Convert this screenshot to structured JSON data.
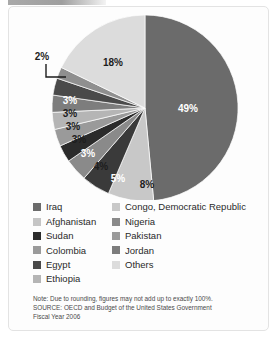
{
  "chart_data": {
    "type": "pie",
    "title": "",
    "subtitle": "",
    "legend_position": "bottom",
    "grid": false,
    "units": "percent",
    "start_angle_deg": 0,
    "direction": "clockwise",
    "categories": [
      "Iraq",
      "Congo, Democratic Republic",
      "Afghanistan",
      "Nigeria",
      "Sudan",
      "Pakistan",
      "Colombia",
      "Jordan",
      "Egypt",
      "Ethiopia",
      "Others"
    ],
    "values": [
      49,
      8,
      5,
      4,
      3,
      3,
      3,
      3,
      3,
      2,
      18
    ],
    "value_labels": [
      "49%",
      "8%",
      "5%",
      "4%",
      "3%",
      "3%",
      "3%",
      "3%",
      "3%",
      "2%",
      "18%"
    ],
    "colors": [
      "#6b6b6b",
      "#c8c8c8",
      "#3a3a3a",
      "#8a8a8a",
      "#2b2b2b",
      "#9a9a9a",
      "#b5b5b5",
      "#7d7d7d",
      "#4a4a4a",
      "#8f8f8f",
      "#dcdcdc"
    ],
    "callout_slices": [
      "Ethiopia"
    ],
    "total": 101
  },
  "pie": {
    "center_x": 145,
    "center_y": 108,
    "radius": 93,
    "slices": [
      {
        "name": "Iraq",
        "label": "49%",
        "value": 49,
        "color": "#6b6b6b",
        "label_x": 188,
        "label_y": 112,
        "label_tone": "light",
        "callout": false
      },
      {
        "name": "Congo, Democratic Republic",
        "label": "8%",
        "value": 8,
        "color": "#c8c8c8",
        "label_x": 147,
        "label_y": 188,
        "label_tone": "dark",
        "callout": false
      },
      {
        "name": "Afghanistan",
        "label": "5%",
        "value": 5,
        "color": "#3a3a3a",
        "label_x": 118,
        "label_y": 182,
        "label_tone": "light",
        "callout": false
      },
      {
        "name": "Nigeria",
        "label": "4%",
        "value": 4,
        "color": "#8a8a8a",
        "label_x": 101,
        "label_y": 170,
        "label_tone": "dark",
        "callout": false
      },
      {
        "name": "Sudan",
        "label": "3%",
        "value": 3,
        "color": "#2b2b2b",
        "label_x": 88,
        "label_y": 157,
        "label_tone": "light",
        "callout": false
      },
      {
        "name": "Pakistan",
        "label": "3%",
        "value": 3,
        "color": "#9a9a9a",
        "label_x": 79,
        "label_y": 143,
        "label_tone": "dark",
        "callout": false
      },
      {
        "name": "Colombia",
        "label": "3%",
        "value": 3,
        "color": "#b5b5b5",
        "label_x": 73,
        "label_y": 130,
        "label_tone": "dark",
        "callout": false
      },
      {
        "name": "Jordan",
        "label": "3%",
        "value": 3,
        "color": "#7d7d7d",
        "label_x": 70,
        "label_y": 117,
        "label_tone": "dark",
        "callout": false
      },
      {
        "name": "Egypt",
        "label": "3%",
        "value": 3,
        "color": "#4a4a4a",
        "label_x": 70,
        "label_y": 104,
        "label_tone": "light",
        "callout": false
      },
      {
        "name": "Ethiopia",
        "label": "2%",
        "value": 2,
        "color": "#8f8f8f",
        "label_x": 42,
        "label_y": 60,
        "label_tone": "dark",
        "callout": true
      },
      {
        "name": "Others",
        "label": "18%",
        "value": 18,
        "color": "#dcdcdc",
        "label_x": 113,
        "label_y": 66,
        "label_tone": "dark",
        "callout": false
      }
    ],
    "callout": {
      "label": "2%",
      "label_x": 42,
      "label_y": 60,
      "path": "M 46 64 L 46 77 L 66 77"
    }
  },
  "legend": {
    "left_column": [
      {
        "label": "Iraq",
        "color": "#6b6b6b"
      },
      {
        "label": "Afghanistan",
        "color": "#c5c5c5"
      },
      {
        "label": "Sudan",
        "color": "#2b2b2b"
      },
      {
        "label": "Colombia",
        "color": "#9a9a9a"
      },
      {
        "label": "Egypt",
        "color": "#4a4a4a"
      },
      {
        "label": "Ethiopia",
        "color": "#b5b5b5"
      }
    ],
    "right_column": [
      {
        "label": "Congo, Democratic Republic",
        "color": "#c8c8c8"
      },
      {
        "label": "Nigeria",
        "color": "#8a8a8a"
      },
      {
        "label": "Pakistan",
        "color": "#9a9a9a"
      },
      {
        "label": "Jordan",
        "color": "#7d7d7d"
      },
      {
        "label": "Others",
        "color": "#dcdcdc"
      }
    ]
  },
  "footnote": {
    "line1": "Note: Due to rounding, figures may not add up to exactly 100%.",
    "line2": "SOURCE: OECD and Budget of the United States Government",
    "line3": "Fiscal Year 2006"
  }
}
